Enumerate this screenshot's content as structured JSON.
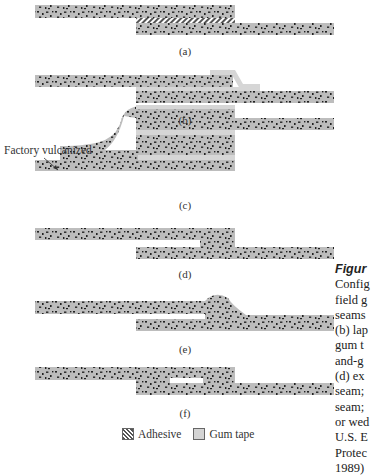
{
  "figure": {
    "panels": [
      {
        "id": "a",
        "label": "(a)"
      },
      {
        "id": "b",
        "label": "(b)"
      },
      {
        "id": "c",
        "label": "(c)"
      },
      {
        "id": "d",
        "label": "(d)"
      },
      {
        "id": "e",
        "label": "(e)"
      },
      {
        "id": "f",
        "label": "(f)"
      }
    ],
    "annotation": "Factory vulcanized",
    "legend": {
      "adhesive": "Adhesive",
      "gum_tape": "Gum tape"
    },
    "colors": {
      "rubber_fill": "#bdbdbd",
      "speckle": "#222222",
      "gum_tape": "#d6d6d6",
      "adhesive_hatch": "#555555"
    }
  },
  "caption": {
    "title": "Figur",
    "lines": [
      "Config",
      "field g",
      "seams",
      "(b) lap",
      "gum t",
      "and-g",
      "(d) ex",
      "seam;",
      "seam;",
      "or wed",
      "U.S. E",
      "Protec",
      "1989)"
    ]
  }
}
